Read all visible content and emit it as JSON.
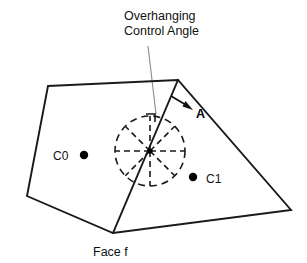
{
  "figure": {
    "background_color": "#ffffff",
    "line_color": "#1a1a1a",
    "leader_color": "#8a8a8a",
    "annotation": {
      "title_line1": "Overhanging",
      "title_line2": "Control Angle",
      "leader_from": {
        "x": 148,
        "y": 46
      },
      "leader_to": {
        "x": 156,
        "y": 114
      }
    },
    "face_label": "Face f",
    "vector_label": "A",
    "cell_labels": {
      "left": "C0",
      "right": "C1"
    },
    "polygon": {
      "name": "face-f-outline",
      "vertices": [
        {
          "x": 48,
          "y": 86
        },
        {
          "x": 178,
          "y": 80
        },
        {
          "x": 291,
          "y": 210
        },
        {
          "x": 113,
          "y": 233
        },
        {
          "x": 27,
          "y": 196
        }
      ]
    },
    "fold_line": {
      "name": "fold-edge",
      "from": {
        "x": 178,
        "y": 80
      },
      "to": {
        "x": 113,
        "y": 233
      }
    },
    "control_circle": {
      "center": {
        "x": 150,
        "y": 151
      },
      "radius": 35,
      "spoke_count": 8,
      "dash_pattern": "7 5"
    },
    "right_angle_marker": {
      "corner": {
        "x": 153,
        "y": 113
      },
      "size": 7
    },
    "normal_arrow": {
      "from": {
        "x": 171,
        "y": 96
      },
      "to": {
        "x": 192,
        "y": 109
      }
    },
    "points": [
      {
        "name": "c0-dot",
        "x": 84,
        "y": 155,
        "r": 4.2,
        "label": "C0",
        "label_x": 53,
        "label_y": 160
      },
      {
        "name": "c1-dot",
        "x": 193,
        "y": 177,
        "r": 4.2,
        "label": "C1",
        "label_x": 206,
        "label_y": 184
      }
    ],
    "face_label_pos": {
      "x": 95,
      "y": 255
    },
    "vector_label_pos": {
      "x": 196,
      "y": 117
    }
  }
}
